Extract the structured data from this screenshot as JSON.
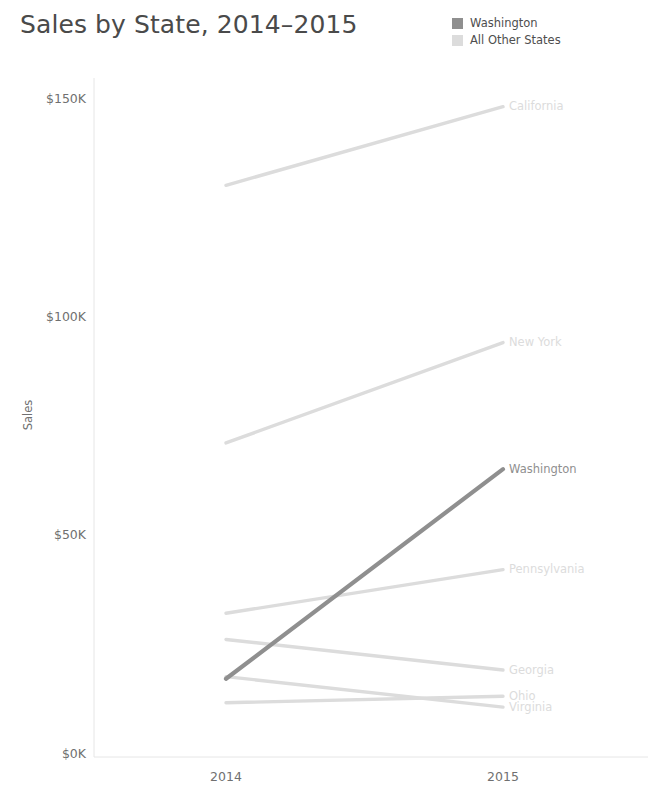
{
  "header": {
    "title": "Sales by State, 2014–2015"
  },
  "legend": {
    "items": [
      {
        "label": "Washington",
        "color": "#8f8f8f"
      },
      {
        "label": "All Other States",
        "color": "#dcdcdc"
      }
    ]
  },
  "chart_data": {
    "type": "line",
    "title": "Sales by State, 2014–2015",
    "xlabel": "",
    "ylabel": "Sales",
    "x": [
      "2014",
      "2015"
    ],
    "categories": [
      "2014",
      "2015"
    ],
    "xtick_labels": [
      "2014",
      "2015"
    ],
    "ytick_labels": [
      "$0K",
      "$50K",
      "$100K",
      "$150K"
    ],
    "ytick_values": [
      0,
      50000,
      100000,
      150000
    ],
    "ylim": [
      0,
      155000
    ],
    "grid": false,
    "legend_position": "top-right",
    "highlight_series": "Washington",
    "series": [
      {
        "name": "California",
        "values": [
          130000,
          148000
        ],
        "highlight": false,
        "color": "#dcdcdc",
        "label_visible": true
      },
      {
        "name": "New York",
        "values": [
          71000,
          94000
        ],
        "highlight": false,
        "color": "#dcdcdc",
        "label_visible": true
      },
      {
        "name": "Washington",
        "values": [
          17000,
          65000
        ],
        "highlight": true,
        "color": "#8f8f8f",
        "label_visible": true
      },
      {
        "name": "Pennsylvania",
        "values": [
          32000,
          42000
        ],
        "highlight": false,
        "color": "#dcdcdc",
        "label_visible": true
      },
      {
        "name": "Georgia",
        "values": [
          26000,
          19000
        ],
        "highlight": false,
        "color": "#dcdcdc",
        "label_visible": true
      },
      {
        "name": "Ohio",
        "values": [
          11500,
          13000
        ],
        "highlight": false,
        "color": "#dcdcdc",
        "label_visible": true
      },
      {
        "name": "Virginia",
        "values": [
          17500,
          10500
        ],
        "highlight": false,
        "color": "#dcdcdc",
        "label_visible": true
      }
    ]
  },
  "axis": {
    "y_title": "Sales",
    "y_ticks": [
      "$150K",
      "$100K",
      "$50K",
      "$0K"
    ],
    "x_ticks": [
      "2014",
      "2015"
    ]
  },
  "colors": {
    "highlight": "#8f8f8f",
    "muted": "#dcdcdc",
    "axis_line": "#e6e6e6",
    "text": "#707070"
  }
}
